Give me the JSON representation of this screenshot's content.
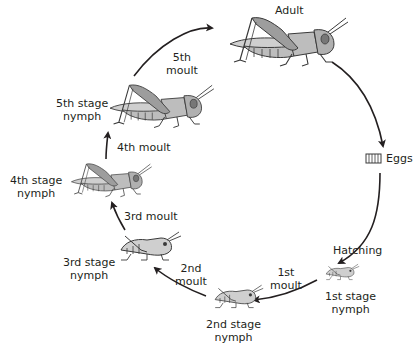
{
  "diagram": {
    "type": "cycle",
    "colors": {
      "background": "#ffffff",
      "body_light": "#d2d2d2",
      "body_mid": "#a8a8a8",
      "outline": "#3a3a3a",
      "arrow": "#231f20",
      "text": "#231f20"
    },
    "stages": [
      {
        "id": "adult",
        "label": "Adult"
      },
      {
        "id": "eggs",
        "label": "Eggs",
        "icon": "eggs-icon"
      },
      {
        "id": "nymph1",
        "label_line1": "1st stage",
        "label_line2": "nymph"
      },
      {
        "id": "nymph2",
        "label_line1": "2nd stage",
        "label_line2": "nymph"
      },
      {
        "id": "nymph3",
        "label_line1": "3rd stage",
        "label_line2": "nymph"
      },
      {
        "id": "nymph4",
        "label_line1": "4th stage",
        "label_line2": "nymph"
      },
      {
        "id": "nymph5",
        "label_line1": "5th stage",
        "label_line2": "nymph"
      }
    ],
    "transitions": [
      {
        "from": "adult",
        "to": "eggs",
        "label": ""
      },
      {
        "from": "eggs",
        "to": "nymph1",
        "label": "Hatching"
      },
      {
        "from": "nymph1",
        "to": "nymph2",
        "label_line1": "1st",
        "label_line2": "moult"
      },
      {
        "from": "nymph2",
        "to": "nymph3",
        "label_line1": "2nd",
        "label_line2": "moult"
      },
      {
        "from": "nymph3",
        "to": "nymph4",
        "label": "3rd moult"
      },
      {
        "from": "nymph4",
        "to": "nymph5",
        "label": "4th moult"
      },
      {
        "from": "nymph5",
        "to": "adult",
        "label_line1": "5th",
        "label_line2": "moult"
      }
    ]
  }
}
